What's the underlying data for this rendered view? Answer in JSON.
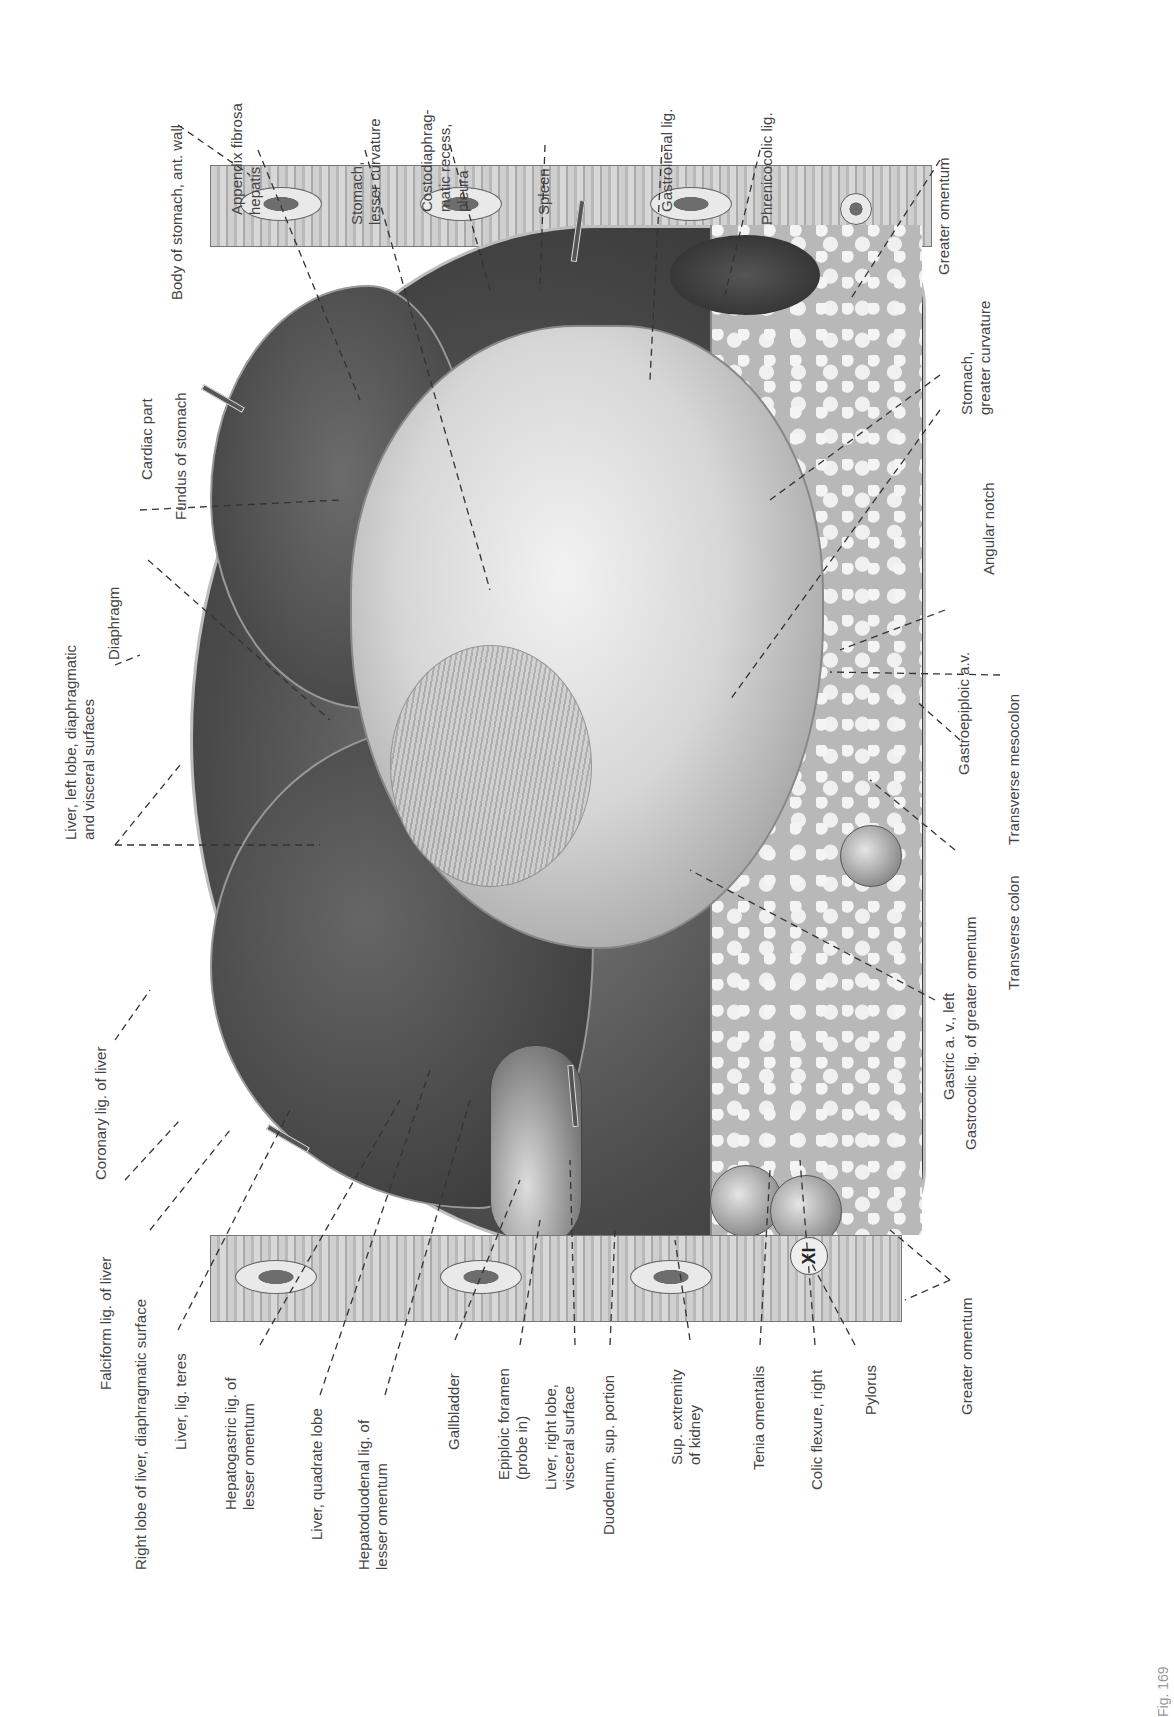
{
  "figure": {
    "orientation": "rotated 90 degrees counter-clockwise",
    "rib_marker": "XI",
    "caption_fragment": "Fig. 169"
  },
  "labels": {
    "top": [
      {
        "id": "body-of-stomach",
        "text": "Body of stomach, ant. wall"
      },
      {
        "id": "appendix-fibrosa",
        "text": "Appendix fibrosa\nhepatis"
      },
      {
        "id": "stomach-lesser-curvature",
        "text": "Stomach,\nlesser curvature"
      },
      {
        "id": "costodiaphragmatic-recess",
        "text": "Costodiaphrag-\nmatic recess,\npleura"
      },
      {
        "id": "spleen",
        "text": "Spleen"
      },
      {
        "id": "gastrolienal-lig",
        "text": "Gastrolienal lig."
      },
      {
        "id": "phrenicocolic-lig",
        "text": "Phrenicocolic lig."
      },
      {
        "id": "greater-omentum-top",
        "text": "Greater omentum"
      }
    ],
    "left": [
      {
        "id": "fundus-of-stomach",
        "text": "Fundus of stomach"
      },
      {
        "id": "cardiac-part",
        "text": "Cardiac part"
      },
      {
        "id": "diaphragm",
        "text": "Diaphragm"
      },
      {
        "id": "liver-left-lobe",
        "text": "Liver, left lobe, diaphragmatic\nand visceral surfaces"
      },
      {
        "id": "coronary-lig",
        "text": "Coronary lig. of liver"
      },
      {
        "id": "falciform-lig",
        "text": "Falciform lig. of liver"
      }
    ],
    "bottom": [
      {
        "id": "right-lobe-liver",
        "text": "Right lobe of liver, diaphragmatic surface"
      },
      {
        "id": "liver-lig-teres",
        "text": "Liver, lig. teres"
      },
      {
        "id": "hepatogastric-lig",
        "text": "Hepatogastric lig. of\nlesser omentum"
      },
      {
        "id": "liver-quadrate-lobe",
        "text": "Liver, quadrate lobe"
      },
      {
        "id": "hepatoduodenal-lig",
        "text": "Hepatoduodenal lig. of\nlesser omentum"
      },
      {
        "id": "gallbladder",
        "text": "Gallbladder"
      },
      {
        "id": "epiploic-foramen",
        "text": "Epiploic foramen\n(probe in)"
      },
      {
        "id": "liver-right-lobe-visceral",
        "text": "Liver, right lobe,\nvisceral surface"
      },
      {
        "id": "duodenum-sup-portion",
        "text": "Duodenum, sup. portion"
      },
      {
        "id": "sup-extremity-kidney",
        "text": "Sup. extremity\nof kidney"
      },
      {
        "id": "tenia-omentalis",
        "text": "Tenia omentalis"
      },
      {
        "id": "colic-flexure-right",
        "text": "Colic flexure, right"
      },
      {
        "id": "pylorus",
        "text": "Pylorus"
      }
    ],
    "right": [
      {
        "id": "stomach-greater-curvature",
        "text": "Stomach,\ngreater curvature"
      },
      {
        "id": "angular-notch",
        "text": "Angular notch"
      },
      {
        "id": "gastroepiploic-av",
        "text": "Gastroepiploic a.v."
      },
      {
        "id": "transverse-mesocolon",
        "text": "Transverse mesocolon"
      },
      {
        "id": "transverse-colon",
        "text": "Transverse colon"
      },
      {
        "id": "gastrocolic-lig",
        "text": "Gastrocolic lig. of greater omentum"
      },
      {
        "id": "gastric-av-left",
        "text": "Gastric a. v., left"
      },
      {
        "id": "greater-omentum-bottom",
        "text": "Greater omentum"
      }
    ]
  }
}
